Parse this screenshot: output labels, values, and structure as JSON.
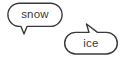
{
  "scene": {
    "title": "two-speech-bubbles",
    "background_color": "#ffffff",
    "stroke_color": "#3a3a3c",
    "text_color": "#3a3a3c"
  },
  "bubbles": [
    {
      "id": "bubble-snow",
      "label": "snow",
      "position": "top-left",
      "tail_direction": "down-left",
      "shape": "rounded-rectangle",
      "bounds": {
        "x": 7,
        "y": 3,
        "width": 55,
        "height": 24
      },
      "label_position": {
        "x": 35,
        "y": 13
      }
    },
    {
      "id": "bubble-ice",
      "label": "ice",
      "position": "bottom-right",
      "tail_direction": "up-left",
      "shape": "rounded-rectangle",
      "bounds": {
        "x": 64,
        "y": 32,
        "width": 54,
        "height": 22
      },
      "label_position": {
        "x": 91,
        "y": 43
      }
    }
  ]
}
